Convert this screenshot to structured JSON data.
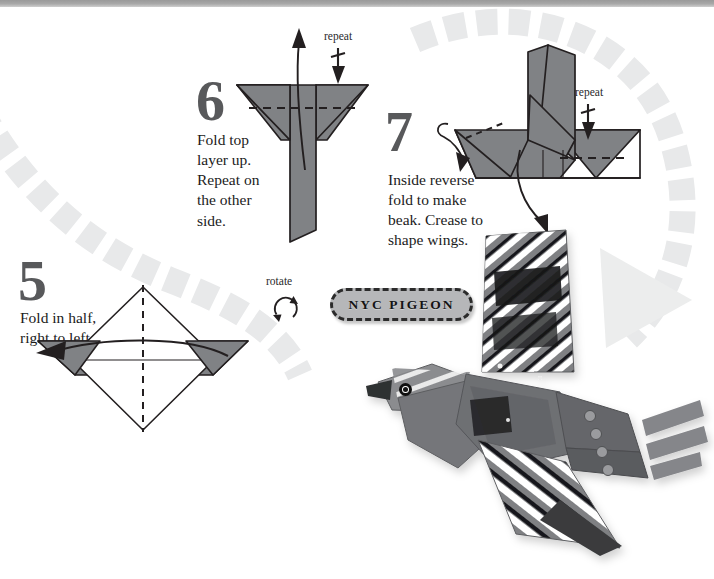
{
  "page": {
    "background_color": "#ffffff",
    "top_band_color": "#a8a8a8",
    "width": 714,
    "height": 579
  },
  "palette": {
    "paper_gray": "#808285",
    "paper_gray_dark": "#6d6f71",
    "paper_white": "#ffffff",
    "ink": "#1b1b1b",
    "numeral_gray": "#58595b",
    "arc_gray": "#e6e7e8",
    "badge_fill": "#b6b7b9",
    "badge_border": "#2b2b2b"
  },
  "steps": [
    {
      "number": "5",
      "instruction": "Fold in half,\nright to left.",
      "instruction_lines": [
        "Fold in half,",
        "right to left."
      ],
      "diagram": "diamond-with-side-flaps",
      "fold_line": "vertical-dashed-center",
      "arrow": "curved-arrow-pointing-left"
    },
    {
      "number": "6",
      "instruction": "Fold top layer up. Repeat on the other side.",
      "instruction_lines": [
        "Fold top",
        "layer up.",
        "Repeat on",
        "the other",
        "side."
      ],
      "diagram": "winged-body-with-tail",
      "fold_line": "horizontal-dashed",
      "arrow": "long-arrow-pointing-up",
      "repeat_label": "repeat"
    },
    {
      "number": "7",
      "instruction": "Inside reverse fold to make beak. Crease to shape wings.",
      "instruction_lines": [
        "Inside reverse",
        "fold to make",
        "beak. Crease to",
        "shape wings."
      ],
      "diagram": "bird-base-with-raised-wings",
      "fold_line": "horizontal-dashed",
      "arrow": "curved-arrow-pointing-down-left",
      "repeat_label": "repeat"
    }
  ],
  "rotate_marker": {
    "label": "rotate",
    "icon": "circular-two-arrow-rotate-icon"
  },
  "badge": {
    "label": "NYC PIGEON",
    "style": "dashed-outline-pill"
  },
  "flow_arrow": {
    "style": "dashed-arc-sweep",
    "direction": "counterclockwise-into-finished-model",
    "color": "#e6e7e8"
  },
  "finished_model": {
    "name": "NYC Pigeon",
    "description": "Folded paper pigeon in flight with striped gray, black and white printed wings",
    "eye": "black-circle-eye"
  }
}
